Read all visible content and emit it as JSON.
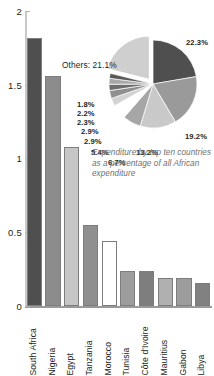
{
  "chart_data": [
    {
      "type": "bar",
      "title": "",
      "xlabel": "",
      "ylabel": "",
      "ylim": [
        0,
        2
      ],
      "yticks": [
        "0",
        "0.5",
        "1",
        "1.5",
        "2"
      ],
      "ytick_values": [
        0,
        0.5,
        1,
        1.5,
        2
      ],
      "grid": false,
      "legend": "none",
      "categories": [
        "South Africa",
        "Nigeria",
        "Egypt",
        "Tanzania",
        "Morocco",
        "Tunisia",
        "Côte d'Ivoire",
        "Mauritius",
        "Gabon",
        "Libya"
      ],
      "values": [
        1.82,
        1.56,
        1.08,
        0.55,
        0.44,
        0.24,
        0.235,
        0.19,
        0.19,
        0.155
      ],
      "bar_colors": [
        "#4f4f4f",
        "#8c8c8c",
        "#c6c6c6",
        "#8f8f8f",
        "#ffffff",
        "#9d9d9d",
        "#7e7e7e",
        "#b0b0b0",
        "#9d9d9d",
        "#818181"
      ]
    },
    {
      "type": "pie",
      "title": "",
      "caption": "Expenditure by top ten countries as a percentage of all African expenditure",
      "legend": "labels-outside",
      "labels": [
        "22.3%",
        "19.2%",
        "13.2%",
        "6.7%",
        "5.4%",
        "2.9%",
        "2.9%",
        "2.3%",
        "2.2%",
        "1.8%",
        "Others: 21.1%"
      ],
      "values": [
        22.3,
        19.2,
        13.2,
        6.7,
        5.4,
        2.9,
        2.9,
        2.3,
        2.2,
        1.8,
        21.1
      ],
      "slice_colors": [
        "#4f4f4f",
        "#9a9a9a",
        "#c9c9c9",
        "#a6a6a6",
        "#ffffff",
        "#d2d2d2",
        "#8f8f8f",
        "#6d6d6d",
        "#a8a8a8",
        "#585858",
        "#cfcfcf"
      ],
      "exploded_slice": "Others: 21.1%"
    }
  ],
  "axes": {
    "y_tick_labels": [
      "2",
      "1.5",
      "1",
      "0.5",
      "0"
    ]
  },
  "inset": {
    "others_label": "Others: 21.1%",
    "caption": "Expenditure by top ten countries as a percentage of all African expenditure",
    "left_labels": [
      "1.8%",
      "2.2%",
      "2.3%",
      "2.9%",
      "2.9%",
      "5.4%"
    ],
    "bottom_labels": [
      "6.7%",
      "13.2%"
    ],
    "right_labels": [
      "22.3%",
      "19.2%"
    ]
  }
}
